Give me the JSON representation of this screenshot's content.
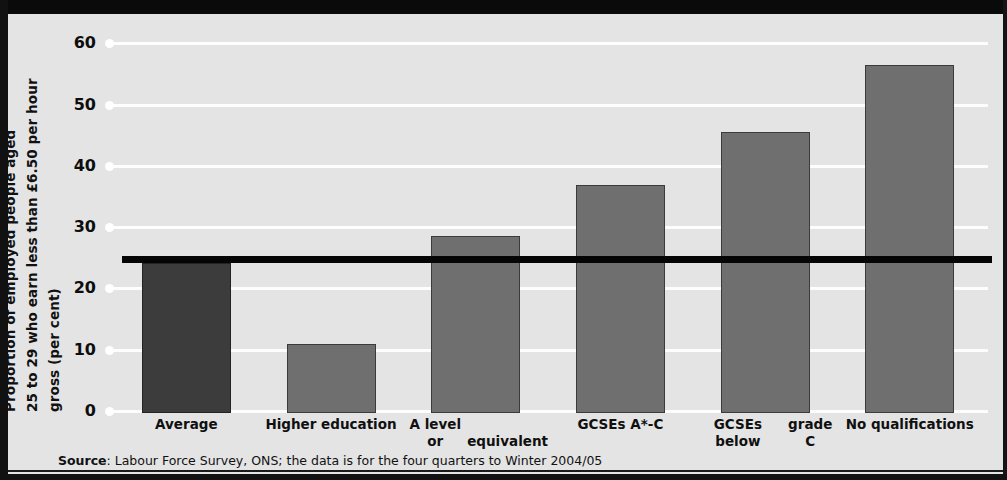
{
  "chart_data": {
    "type": "bar",
    "title": "",
    "xlabel": "",
    "ylabel": "Proportion of employed people aged 25 to 29 who earn less than £6.50 per hour gross (per cent)",
    "ylabel_line1": "Proportion of employed people aged",
    "ylabel_line2": "25 to 29 who earn less than £6.50 per hour",
    "ylabel_line3": "gross (per cent)",
    "categories": [
      "Average",
      "Higher education",
      "A level or equivalent",
      "GCSEs A*-C",
      "GCSEs below grade C",
      "No qualifications"
    ],
    "category_lines": [
      [
        "Average"
      ],
      [
        "Higher education"
      ],
      [
        "A level or",
        "equivalent"
      ],
      [
        "GCSEs A*-C"
      ],
      [
        "GCSEs below",
        "grade C"
      ],
      [
        "No qualifications"
      ]
    ],
    "values": [
      24.5,
      11.2,
      28.8,
      37.2,
      45.8,
      56.7
    ],
    "ylim": [
      0,
      62
    ],
    "yticks": [
      0,
      10,
      20,
      30,
      40,
      50,
      60
    ],
    "ytick_labels": [
      "0",
      "10",
      "20",
      "30",
      "40",
      "50",
      "60"
    ],
    "grid": true,
    "legend": "none",
    "annotations": [
      {
        "name": "average-reference-line",
        "type": "horizontal-line",
        "value": 25.0,
        "color": "#050505",
        "description": "Black horizontal reference line at the Average level"
      }
    ],
    "colors": {
      "bar_default": "#6f6f6f",
      "bar_highlight": "#3c3c3c",
      "plot_background": "#e4e4e4",
      "gridline": "#fdfdfd",
      "reference_line": "#050505",
      "frame": "#111111"
    },
    "highlight_index": 0
  },
  "source": {
    "label": "Source",
    "text": ": Labour Force Survey, ONS; the data is for the four quarters to Winter 2004/05"
  }
}
